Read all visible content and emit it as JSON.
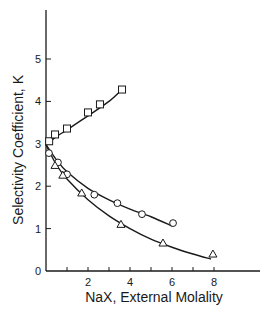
{
  "chart_data": {
    "type": "scatter",
    "title": "",
    "xlabel": "NaX, External Molality",
    "ylabel": "Selectivity Coefficient, K",
    "xlim": [
      0,
      10
    ],
    "ylim": [
      0,
      6
    ],
    "x_ticks": [
      0,
      1,
      2,
      3,
      4,
      5,
      6,
      7,
      8
    ],
    "x_tick_labels": [
      "",
      "",
      "2",
      "",
      "4",
      "",
      "6",
      "",
      "8"
    ],
    "y_ticks": [
      0,
      1,
      2,
      3,
      4,
      5
    ],
    "y_tick_labels": [
      "0",
      "1",
      "2",
      "3",
      "4",
      "5"
    ],
    "grid": false,
    "legend": "none",
    "series": [
      {
        "name": "squares",
        "marker": "square",
        "points": [
          [
            0.15,
            3.06
          ],
          [
            0.43,
            3.22
          ],
          [
            1.0,
            3.36
          ],
          [
            2.0,
            3.74
          ],
          [
            2.57,
            3.93
          ],
          [
            3.62,
            4.28
          ]
        ],
        "curve": [
          [
            0,
            2.98
          ],
          [
            0.5,
            3.17
          ],
          [
            1.0,
            3.33
          ],
          [
            2.0,
            3.66
          ],
          [
            3.0,
            4.0
          ],
          [
            3.62,
            4.28
          ]
        ]
      },
      {
        "name": "circles",
        "marker": "circle",
        "points": [
          [
            0.14,
            2.78
          ],
          [
            0.57,
            2.56
          ],
          [
            1.0,
            2.28
          ],
          [
            2.3,
            1.8
          ],
          [
            3.4,
            1.6
          ],
          [
            4.57,
            1.34
          ],
          [
            6.05,
            1.13
          ]
        ],
        "curve": [
          [
            0,
            2.98
          ],
          [
            0.5,
            2.62
          ],
          [
            1.0,
            2.34
          ],
          [
            2.0,
            1.95
          ],
          [
            3.0,
            1.68
          ],
          [
            4.0,
            1.46
          ],
          [
            5.0,
            1.28
          ],
          [
            6.0,
            1.06
          ]
        ]
      },
      {
        "name": "triangles",
        "marker": "triangle",
        "points": [
          [
            0.43,
            2.49
          ],
          [
            0.8,
            2.26
          ],
          [
            1.7,
            1.84
          ],
          [
            3.57,
            1.1
          ],
          [
            5.57,
            0.66
          ],
          [
            7.95,
            0.4
          ]
        ],
        "curve": [
          [
            0,
            2.98
          ],
          [
            0.5,
            2.5
          ],
          [
            1.0,
            2.17
          ],
          [
            2.0,
            1.68
          ],
          [
            3.0,
            1.3
          ],
          [
            4.0,
            1.0
          ],
          [
            5.0,
            0.75
          ],
          [
            6.0,
            0.56
          ],
          [
            7.0,
            0.4
          ],
          [
            7.86,
            0.28
          ]
        ]
      }
    ]
  }
}
